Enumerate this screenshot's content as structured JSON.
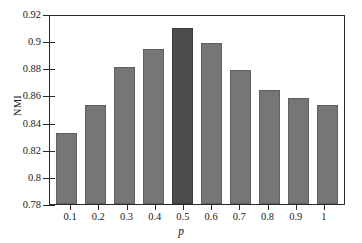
{
  "chart_data": {
    "type": "bar",
    "title": "",
    "xlabel": "p",
    "ylabel": "NMI",
    "categories": [
      "0.1",
      "0.2",
      "0.3",
      "0.4",
      "0.5",
      "0.6",
      "0.7",
      "0.8",
      "0.9",
      "1"
    ],
    "values": [
      0.832,
      0.853,
      0.881,
      0.894,
      0.91,
      0.899,
      0.879,
      0.864,
      0.858,
      0.853
    ],
    "highlight_index": 4,
    "ylim": [
      0.78,
      0.92
    ],
    "yticks": [
      "0.78",
      "0.8",
      "0.82",
      "0.84",
      "0.86",
      "0.88",
      "0.9",
      "0.92"
    ],
    "ytick_values": [
      0.78,
      0.8,
      0.82,
      0.84,
      0.86,
      0.88,
      0.9,
      0.92
    ],
    "grid": false,
    "legend": null,
    "colors": {
      "bar": "#767676",
      "bar_highlight": "#4b4b4b",
      "axis": "#2a2a2a",
      "background": "#ffffff",
      "text": "#1a1a1a"
    }
  }
}
